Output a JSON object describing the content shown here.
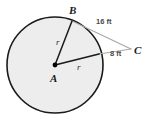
{
  "figure": {
    "type": "geometry-diagram",
    "background_color": "#ffffff",
    "circle": {
      "fill_color": "#eeeeee",
      "stroke_color": "#1a1a1a",
      "center_label": "A",
      "center_x": 55,
      "center_y": 65,
      "radius": 48
    },
    "center_dot": {
      "color": "#000000"
    },
    "vertices": [
      {
        "name": "A",
        "label": "A",
        "x": 55,
        "y": 65
      },
      {
        "name": "B",
        "label": "B",
        "x": 72,
        "y": 20
      },
      {
        "name": "C",
        "label": "C",
        "x": 131,
        "y": 49
      }
    ],
    "segments": [
      {
        "name": "radius-AB",
        "label": "r",
        "from": "A",
        "to": "B",
        "color": "#1a1a1a"
      },
      {
        "name": "radius-AT",
        "label": "r",
        "from": "A",
        "to": "tangent-point",
        "color": "#1a1a1a"
      },
      {
        "name": "chord-BC",
        "label": "16 ft",
        "from": "B",
        "to": "C",
        "color": "#9a9a9a"
      },
      {
        "name": "secant-TC",
        "label": "8 ft",
        "from": "tangent-point",
        "to": "C",
        "color": "#9a9a9a"
      }
    ],
    "labels": {
      "center": "A",
      "top_point": "B",
      "external_point": "C",
      "radius_upper": "r",
      "radius_lower": "r",
      "measure_bc": "16 ft",
      "measure_tc": "8 ft"
    }
  }
}
